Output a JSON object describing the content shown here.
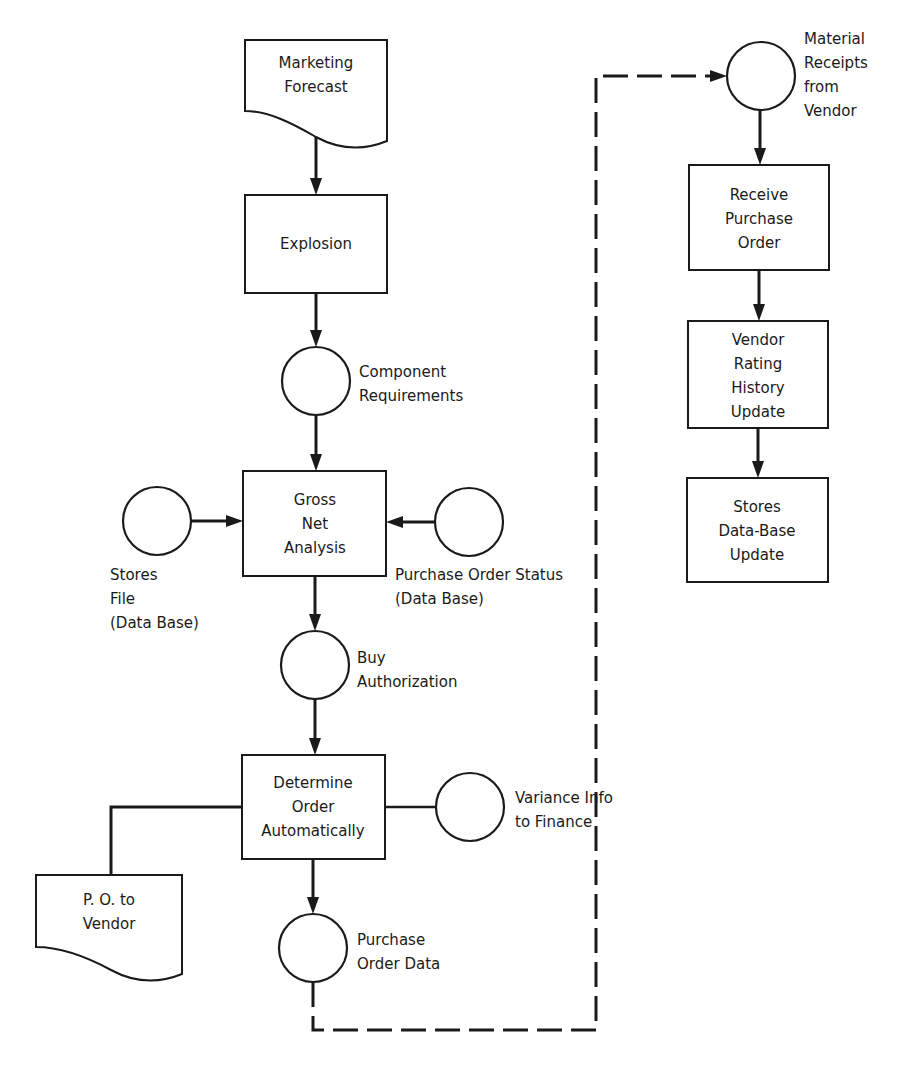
{
  "diagram": {
    "type": "flowchart",
    "nodes": {
      "marketing_forecast": {
        "shape": "document",
        "lines": [
          "Marketing",
          "Forecast"
        ]
      },
      "explosion": {
        "shape": "process",
        "lines": [
          "Explosion"
        ]
      },
      "component_requirements": {
        "shape": "connector",
        "lines": [
          "Component",
          "Requirements"
        ]
      },
      "gross_net_analysis": {
        "shape": "process",
        "lines": [
          "Gross",
          "Net",
          "Analysis"
        ]
      },
      "stores_file": {
        "shape": "connector",
        "lines": [
          "Stores",
          "File",
          "(Data Base)"
        ]
      },
      "purchase_order_status": {
        "shape": "connector",
        "lines": [
          "Purchase Order Status",
          "(Data Base)"
        ]
      },
      "buy_authorization": {
        "shape": "connector",
        "lines": [
          "Buy",
          "Authorization"
        ]
      },
      "determine_order": {
        "shape": "process",
        "lines": [
          "Determine",
          "Order",
          "Automatically"
        ]
      },
      "po_to_vendor": {
        "shape": "document",
        "lines": [
          "P. O. to",
          "Vendor"
        ]
      },
      "variance_info": {
        "shape": "connector",
        "lines": [
          "Variance Info",
          "to Finance"
        ]
      },
      "purchase_order_data": {
        "shape": "connector",
        "lines": [
          "Purchase",
          "Order Data"
        ]
      },
      "material_receipts": {
        "shape": "connector",
        "lines": [
          "Material",
          "Receipts",
          "from",
          "Vendor"
        ]
      },
      "receive_po": {
        "shape": "process",
        "lines": [
          "Receive",
          "Purchase",
          "Order"
        ]
      },
      "vendor_rating": {
        "shape": "process",
        "lines": [
          "Vendor",
          "Rating",
          "History",
          "Update"
        ]
      },
      "stores_db_update": {
        "shape": "process",
        "lines": [
          "Stores",
          "Data-Base",
          "Update"
        ]
      }
    },
    "edges": [
      {
        "from": "marketing_forecast",
        "to": "explosion",
        "style": "solid"
      },
      {
        "from": "explosion",
        "to": "component_requirements",
        "style": "solid"
      },
      {
        "from": "component_requirements",
        "to": "gross_net_analysis",
        "style": "solid"
      },
      {
        "from": "stores_file",
        "to": "gross_net_analysis",
        "style": "solid"
      },
      {
        "from": "purchase_order_status",
        "to": "gross_net_analysis",
        "style": "solid"
      },
      {
        "from": "gross_net_analysis",
        "to": "buy_authorization",
        "style": "solid"
      },
      {
        "from": "buy_authorization",
        "to": "determine_order",
        "style": "solid"
      },
      {
        "from": "determine_order",
        "to": "po_to_vendor",
        "style": "solid"
      },
      {
        "from": "determine_order",
        "to": "variance_info",
        "style": "solid"
      },
      {
        "from": "determine_order",
        "to": "purchase_order_data",
        "style": "solid"
      },
      {
        "from": "purchase_order_data",
        "to": "material_receipts",
        "style": "dashed"
      },
      {
        "from": "material_receipts",
        "to": "receive_po",
        "style": "solid"
      },
      {
        "from": "receive_po",
        "to": "vendor_rating",
        "style": "solid"
      },
      {
        "from": "vendor_rating",
        "to": "stores_db_update",
        "style": "solid"
      }
    ]
  }
}
